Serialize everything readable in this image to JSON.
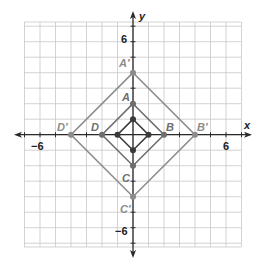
{
  "diagram": {
    "type": "coordinate-plane-dilation",
    "axes": {
      "x_label": "x",
      "y_label": "y",
      "ticks": {
        "x_neg": "−6",
        "x_pos": "6",
        "y_pos": "6",
        "y_neg": "−6"
      },
      "range": {
        "xmin": -7,
        "xmax": 7,
        "ymin": -7,
        "ymax": 7
      }
    },
    "colors": {
      "grid": "#c8c8c8",
      "axis": "#2a2a2a",
      "inner": "#3a3a3a",
      "original": "#6e6e6e",
      "image": "#8c8c8c"
    },
    "figures": [
      {
        "name": "inner-square",
        "vertices": [
          [
            0,
            1
          ],
          [
            1,
            0
          ],
          [
            0,
            -1
          ],
          [
            -1,
            0
          ]
        ],
        "labels": []
      },
      {
        "name": "ABCD",
        "vertices": [
          [
            0,
            2
          ],
          [
            2,
            0
          ],
          [
            0,
            -2
          ],
          [
            -2,
            0
          ]
        ],
        "labels": [
          "A",
          "B",
          "C",
          "D"
        ]
      },
      {
        "name": "A'B'C'D'",
        "vertices": [
          [
            0,
            4
          ],
          [
            4,
            0
          ],
          [
            0,
            -4
          ],
          [
            -4,
            0
          ]
        ],
        "labels": [
          "A′",
          "B′",
          "C′",
          "D′"
        ]
      }
    ]
  }
}
